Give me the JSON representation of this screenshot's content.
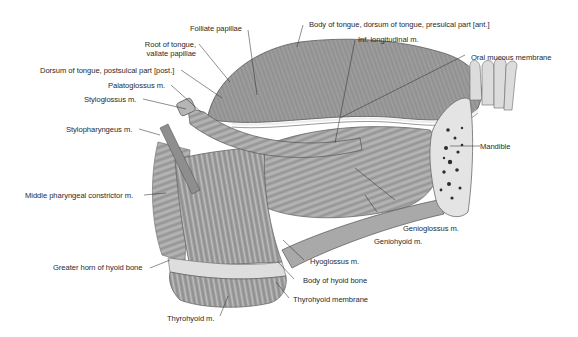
{
  "figure": {
    "background": "#ffffff",
    "tissue_colors": {
      "muscle_dark": "#6e6e6e",
      "muscle_mid": "#9a9a9a",
      "muscle_light": "#c4c4c4",
      "bone_light": "#e6e6e6",
      "bone_pore": "#2b2b2b",
      "leader_line": "#333333"
    }
  },
  "labels": {
    "folliate_papillae": "Folliate papillae",
    "root_of_tongue_1": "Root of tongue,",
    "root_of_tongue_2": "vallate papillae",
    "dorsum_postsulcal": "Dorsum of tongue, postsulcal part [post.]",
    "palatoglossus": "Palatoglossus m.",
    "styloglossus": "Styloglossus m.",
    "stylopharyngeus": "Stylopharyngeus m.",
    "middle_pharyngeal_constrictor": "Middle pharyngeal constrictor m.",
    "greater_horn_hyoid": "Greater horn of hyoid bone",
    "thyrohyoid_m": "Thyrohyoid m.",
    "body_of_tongue": "Body of tongue, dorsum of tongue, presulcal part [ant.]",
    "inf_longitudinal": "Inf. longitudinal m.",
    "oral_mucous_membrane": "Oral mucous membrane",
    "mandible": "Mandible",
    "genioglossus": "Genioglossus m.",
    "geniohyoid": "Geniohyoid m.",
    "hyoglossus": "Hyoglossus m.",
    "body_of_hyoid_bone": "Body of hyoid bone",
    "thyrohyoid_membrane": "Thyrohyoid membrane"
  }
}
